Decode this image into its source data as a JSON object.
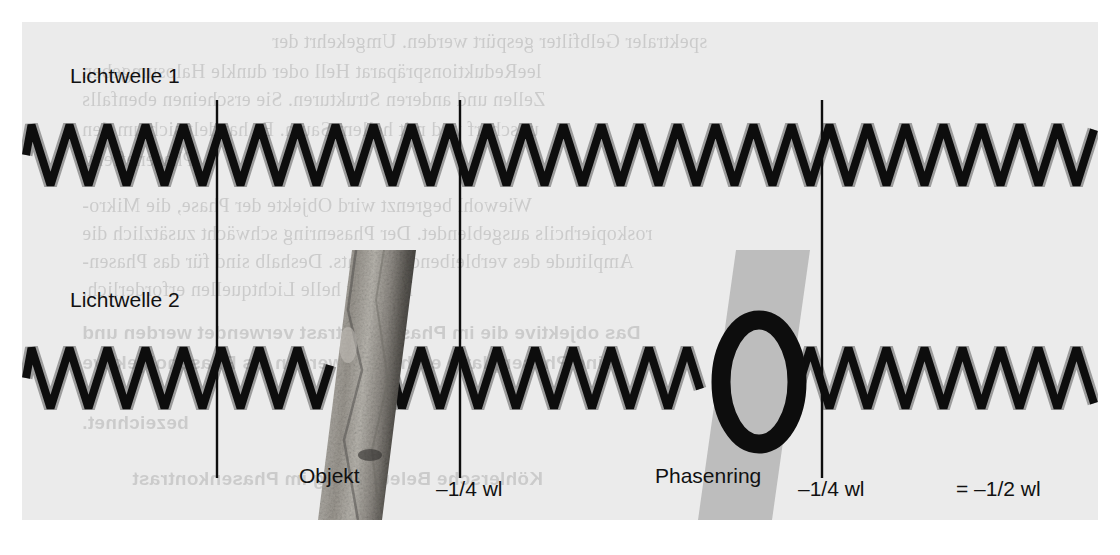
{
  "figure": {
    "background_color": "#ebebeb",
    "page_color": "#ffffff",
    "ink_color": "#0d0d0d"
  },
  "labels": {
    "wave1": "Lichtwelle 1",
    "wave2": "Lichtwelle 2",
    "objekt": "Objekt",
    "phasenring": "Phasenring",
    "shift1": "–1/4 wl",
    "shift2": "–1/4 wl",
    "total": "= –1/2 wl"
  },
  "chart_data": {
    "type": "line",
    "xlabel": "",
    "ylabel": "",
    "grid": false,
    "legend_position": "left",
    "series": [
      {
        "name": "Lichtwelle 1",
        "baseline_y": 155,
        "amplitude": 30,
        "wavelength": 38,
        "phase_shift_at_markers": [
          0,
          0,
          0
        ],
        "waveform": "triangle",
        "x_start": 26,
        "x_end": 1094,
        "color": "#0d0d0d"
      },
      {
        "name": "Lichtwelle 2",
        "baseline_y": 378,
        "amplitude": 30,
        "wavelength": 38,
        "waveform": "triangle",
        "x_start": 26,
        "x_end": 1094,
        "color": "#0d0d0d",
        "segments": [
          {
            "from_x": 26,
            "to_x": 330,
            "phase_offset_wl": 0,
            "note": "in phase with Lichtwelle 1"
          },
          {
            "from_x": 394,
            "to_x": 700,
            "phase_offset_wl": -0.25,
            "note": "after Objekt: –1/4 wl"
          },
          {
            "from_x": 790,
            "to_x": 1094,
            "phase_offset_wl": -0.5,
            "note": "after Phasenring: total –1/2 wl"
          }
        ]
      }
    ],
    "markers": [
      {
        "label": "",
        "x": 217,
        "note": "reference, waves in phase"
      },
      {
        "label": "–1/4 wl",
        "x": 460,
        "note": "phase shift caused by Objekt"
      },
      {
        "label": "–1/4 wl",
        "x": 822,
        "note": "phase shift caused by Phasenring"
      },
      {
        "label": "= –1/2 wl",
        "x": 1000,
        "note": "resulting total phase shift"
      }
    ],
    "elements": [
      {
        "name": "Objekt",
        "type": "parallelogram-slab",
        "x": 296,
        "y": 228,
        "width": 98,
        "height": 270,
        "fill": "textured-gray"
      },
      {
        "name": "Phasenring",
        "type": "parallelogram-slab-with-ring",
        "x": 676,
        "y": 228,
        "width": 112,
        "height": 270,
        "fill": "#b9b9b9",
        "ring_color": "#0d0d0d"
      }
    ]
  },
  "ghost_text": {
    "description": "faint mirrored show-through text from reverse side of the scanned book page",
    "lines": [
      {
        "text": "spektraler Gelbfilter gespürt werden. Umgekehrt der",
        "x": 250,
        "y": 8,
        "size": 20,
        "bold": false
      },
      {
        "text": "leeReduktionspräparat Hell oder dunkle Halosumgeben",
        "x": 60,
        "y": 38,
        "size": 20,
        "bold": false
      },
      {
        "text": "Zellen und anderen Strukturen. Sie erscheinen ebenfalls",
        "x": 60,
        "y": 66,
        "size": 20,
        "bold": false
      },
      {
        "text": "unscharf und mit hellem Saum. Es handelt sich um den",
        "x": 60,
        "y": 96,
        "size": 20,
        "bold": false
      },
      {
        "text": "Phaseneffekt.",
        "x": 60,
        "y": 126,
        "size": 20,
        "bold": false
      },
      {
        "text": "Wiewohl begrenzt wird Objekte der Phase, die Mikro-",
        "x": 60,
        "y": 172,
        "size": 20,
        "bold": false
      },
      {
        "text": "roskopierhcils ausgeblendet. Der Phasenring schwächt zusätzlich die",
        "x": 60,
        "y": 200,
        "size": 20,
        "bold": false
      },
      {
        "text": "Amplitude des verbleibenden Lichts. Deshalb sind für das Phasen-",
        "x": 60,
        "y": 228,
        "size": 20,
        "bold": false
      },
      {
        "text": "kontrast helle Lichtquellen erforderlich.",
        "x": 60,
        "y": 256,
        "size": 20,
        "bold": false
      },
      {
        "text": "Das objektive die im Phasenkontrast verwendet werden und",
        "x": 60,
        "y": 300,
        "size": 19,
        "bold": true
      },
      {
        "text": "eine Phasenplatte enthalten, werden als Phasenobjektive",
        "x": 60,
        "y": 330,
        "size": 19,
        "bold": true
      },
      {
        "text": "bezeichnet.",
        "x": 60,
        "y": 390,
        "size": 19,
        "bold": true
      },
      {
        "text": "Köhlersche Beleuchtung im Phasenkontrast",
        "x": 110,
        "y": 446,
        "size": 19,
        "bold": true
      }
    ]
  }
}
